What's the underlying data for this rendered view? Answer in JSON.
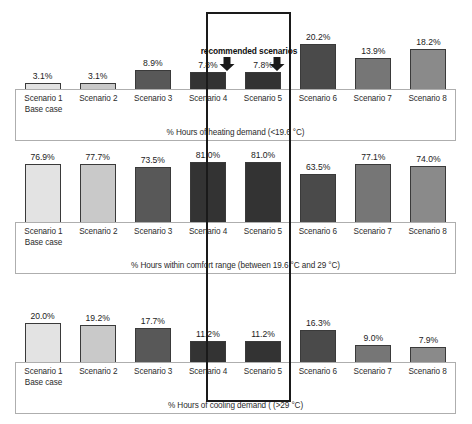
{
  "annotation": {
    "recommended_label": "recommended scenarios",
    "arrow_icon": "arrow-down-icon",
    "highlight_color": "#1a1a1a"
  },
  "categories": [
    {
      "line1": "Scenario 1",
      "line2": "Base case"
    },
    {
      "line1": "Scenario 2",
      "line2": ""
    },
    {
      "line1": "Scenario 3",
      "line2": ""
    },
    {
      "line1": "Scenario 4",
      "line2": ""
    },
    {
      "line1": "Scenario 5",
      "line2": ""
    },
    {
      "line1": "Scenario 6",
      "line2": ""
    },
    {
      "line1": "Scenario 7",
      "line2": ""
    },
    {
      "line1": "Scenario 8",
      "line2": ""
    }
  ],
  "palette": {
    "scenario1": "#e3e3e3",
    "scenario2": "#c9c9c9",
    "scenario3": "#585858",
    "scenario4": "#333333",
    "scenario5": "#333333",
    "scenario6": "#4a4a4a",
    "scenario7": "#767676",
    "scenario8": "#8a8a8a",
    "bar_outline": "#3a3a3a",
    "panel_border": "#aeaeae"
  },
  "chart_data": [
    {
      "type": "bar",
      "title": "",
      "xlabel": "% Hours of heating demand (<19.6 °C)",
      "ylabel": "",
      "ylim": [
        0,
        100
      ],
      "grid": false,
      "legend": "none",
      "categories": [
        "Scenario 1 Base case",
        "Scenario 2",
        "Scenario 3",
        "Scenario 4",
        "Scenario 5",
        "Scenario 6",
        "Scenario 7",
        "Scenario 8"
      ],
      "values": [
        3.1,
        3.1,
        8.9,
        7.8,
        7.8,
        20.2,
        13.9,
        18.2
      ],
      "value_labels": [
        "3.1%",
        "3.1%",
        "8.9%",
        "7.8%",
        "7.8%",
        "20.2%",
        "13.9%",
        "18.2%"
      ],
      "colors": [
        "#e3e3e3",
        "#c9c9c9",
        "#585858",
        "#333333",
        "#333333",
        "#4a4a4a",
        "#767676",
        "#8a8a8a"
      ]
    },
    {
      "type": "bar",
      "title": "",
      "xlabel": "% Hours within comfort range  (between 19.6 °C and 29 °C)",
      "ylabel": "",
      "ylim": [
        0,
        100
      ],
      "grid": false,
      "legend": "none",
      "categories": [
        "Scenario 1 Base case",
        "Scenario 2",
        "Scenario 3",
        "Scenario 4",
        "Scenario 5",
        "Scenario 6",
        "Scenario 7",
        "Scenario 8"
      ],
      "values": [
        76.9,
        77.7,
        73.5,
        81.0,
        81.0,
        63.5,
        77.1,
        74.0
      ],
      "value_labels": [
        "76.9%",
        "77.7%",
        "73.5%",
        "81.0%",
        "81.0%",
        "63.5%",
        "77.1%",
        "74.0%"
      ],
      "colors": [
        "#e3e3e3",
        "#c9c9c9",
        "#585858",
        "#333333",
        "#333333",
        "#4a4a4a",
        "#767676",
        "#8a8a8a"
      ]
    },
    {
      "type": "bar",
      "title": "",
      "xlabel": "% Hours of cooling demand ( (>29 °C)",
      "ylabel": "",
      "ylim": [
        0,
        100
      ],
      "grid": false,
      "legend": "none",
      "categories": [
        "Scenario 1 Base case",
        "Scenario 2",
        "Scenario 3",
        "Scenario 4",
        "Scenario 5",
        "Scenario 6",
        "Scenario 7",
        "Scenario 8"
      ],
      "values": [
        20.0,
        19.2,
        17.7,
        11.2,
        11.2,
        16.3,
        9.0,
        7.9
      ],
      "value_labels": [
        "20.0%",
        "19.2%",
        "17.7%",
        "11.2%",
        "11.2%",
        "16.3%",
        "9.0%",
        "7.9%"
      ],
      "colors": [
        "#e3e3e3",
        "#c9c9c9",
        "#585858",
        "#333333",
        "#333333",
        "#4a4a4a",
        "#767676",
        "#8a8a8a"
      ]
    }
  ]
}
